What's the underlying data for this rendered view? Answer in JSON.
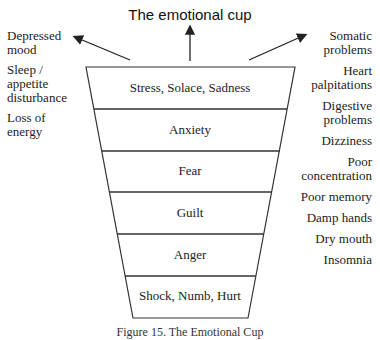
{
  "title": "The emotional cup",
  "left_effects": [
    "Depressed mood",
    "Sleep / appetite disturbance",
    "Loss of energy"
  ],
  "left_effects_lines": [
    [
      "Depressed",
      "mood"
    ],
    [
      "Sleep /",
      "appetite",
      "disturbance"
    ],
    [
      "Loss of",
      "energy"
    ]
  ],
  "right_effects": [
    "Somatic problems",
    "Heart palpitations",
    "Digestive problems",
    "Dizziness",
    "Poor concentration",
    "Poor memory",
    "Damp hands",
    "Dry mouth",
    "Insomnia"
  ],
  "cup_layers": [
    "Stress, Solace, Sadness",
    "Anxiety",
    "Fear",
    "Guilt",
    "Anger",
    "Shock, Numb, Hurt"
  ],
  "caption": "Figure 15. The Emotional Cup",
  "colors": {
    "line": "#333333",
    "text": "#222222"
  }
}
